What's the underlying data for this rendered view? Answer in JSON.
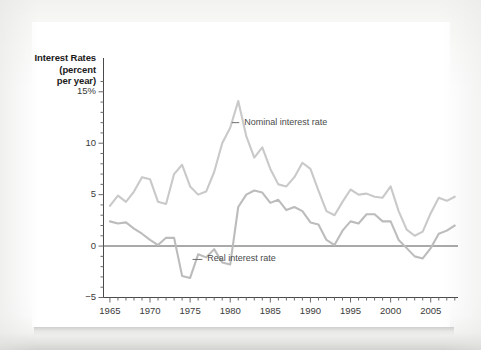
{
  "chart_data": {
    "type": "line",
    "title": "",
    "ylabel": "Interest Rates (percent per year)",
    "ylabel_lines": [
      "Interest Rates",
      "(percent",
      "per year)"
    ],
    "xlabel": "",
    "ylim": [
      -5,
      16
    ],
    "xlim": [
      1964.2,
      2008.4
    ],
    "yticks": [
      -5,
      0,
      5,
      10,
      15
    ],
    "ytick_labels": [
      "−5",
      "0",
      "5",
      "10",
      "15%"
    ],
    "xticks": [
      1965,
      1970,
      1975,
      1980,
      1985,
      1990,
      1995,
      2000,
      2005
    ],
    "xtick_labels": [
      "1965",
      "1970",
      "1975",
      "1980",
      "1985",
      "1990",
      "1995",
      "2000",
      "2005"
    ],
    "x_minor_tick_step": 1,
    "y_minor_tick_step": 1,
    "grid": false,
    "zero_line": 0,
    "legend_position": "inline-annotations",
    "annotations": [
      {
        "text": "Nominal interest rate",
        "x": 1981.5,
        "y": 12.0,
        "leader_from_x": 1980.2
      },
      {
        "text": "Real interest rate",
        "x": 1976.9,
        "y": -1.3,
        "leader_from_x": 1975.3
      }
    ],
    "series": [
      {
        "name": "Nominal interest rate",
        "color": "#c9c9c9",
        "x": [
          1965,
          1966,
          1967,
          1968,
          1969,
          1970,
          1971,
          1972,
          1973,
          1974,
          1975,
          1976,
          1977,
          1978,
          1979,
          1980,
          1981,
          1982,
          1983,
          1984,
          1985,
          1986,
          1987,
          1988,
          1989,
          1990,
          1991,
          1992,
          1993,
          1994,
          1995,
          1996,
          1997,
          1998,
          1999,
          2000,
          2001,
          2002,
          2003,
          2004,
          2005,
          2006,
          2007,
          2008
        ],
        "values": [
          3.9,
          4.9,
          4.3,
          5.3,
          6.7,
          6.5,
          4.3,
          4.1,
          7.0,
          7.9,
          5.8,
          5.0,
          5.3,
          7.2,
          10.0,
          11.5,
          14.1,
          10.7,
          8.6,
          9.6,
          7.5,
          6.0,
          5.8,
          6.7,
          8.1,
          7.5,
          5.4,
          3.4,
          3.0,
          4.3,
          5.5,
          5.0,
          5.1,
          4.8,
          4.7,
          5.8,
          3.4,
          1.6,
          1.0,
          1.4,
          3.2,
          4.7,
          4.4,
          4.8
        ]
      },
      {
        "name": "Real interest rate",
        "color": "#bcbcbc",
        "x": [
          1965,
          1966,
          1967,
          1968,
          1969,
          1970,
          1971,
          1972,
          1973,
          1974,
          1975,
          1976,
          1977,
          1978,
          1979,
          1980,
          1981,
          1982,
          1983,
          1984,
          1985,
          1986,
          1987,
          1988,
          1989,
          1990,
          1991,
          1992,
          1993,
          1994,
          1995,
          1996,
          1997,
          1998,
          1999,
          2000,
          2001,
          2002,
          2003,
          2004,
          2005,
          2006,
          2007,
          2008
        ],
        "values": [
          2.4,
          2.2,
          2.3,
          1.7,
          1.2,
          0.6,
          0.1,
          0.8,
          0.8,
          -2.9,
          -3.1,
          -0.8,
          -1.1,
          -0.3,
          -1.6,
          -1.8,
          3.8,
          5.0,
          5.4,
          5.2,
          4.2,
          4.5,
          3.5,
          3.8,
          3.4,
          2.3,
          2.1,
          0.6,
          0.1,
          1.5,
          2.4,
          2.2,
          3.1,
          3.1,
          2.4,
          2.4,
          0.6,
          -0.2,
          -1.0,
          -1.2,
          -0.2,
          1.2,
          1.5,
          2.0
        ]
      }
    ]
  },
  "axis": {
    "axis_color": "#4a4a4a",
    "zero_line_color": "#555555",
    "tick_color": "#6a6a6a",
    "label_color": "#3a3a3a"
  }
}
